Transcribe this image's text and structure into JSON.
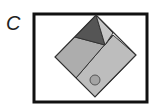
{
  "label": "C",
  "colors": {
    "frame": "#111111",
    "panel_light": "#b8b8b8",
    "panel_mid": "#a8a8a8",
    "dark_triangle": "#555555",
    "light_triangle": "#c4c4c4",
    "circle": "#a0a0a0",
    "stroke": "#333333"
  }
}
